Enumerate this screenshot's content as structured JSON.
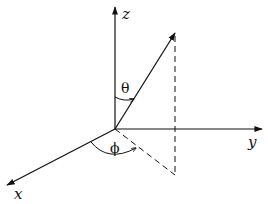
{
  "diagram": {
    "axes": [
      {
        "name": "z",
        "label": "z",
        "from": [
          115,
          129
        ],
        "to": [
          115,
          8
        ],
        "label_pos": [
          124,
          18
        ]
      },
      {
        "name": "y",
        "label": "y",
        "from": [
          115,
          129
        ],
        "to": [
          261,
          129
        ],
        "label_pos": [
          252,
          147
        ]
      },
      {
        "name": "x",
        "label": "x",
        "from": [
          115,
          129
        ],
        "to": [
          8,
          185
        ],
        "label_pos": [
          15,
          198
        ]
      }
    ],
    "vector": {
      "from": [
        115,
        129
      ],
      "to": [
        175,
        34
      ]
    },
    "projections": {
      "vertical": {
        "from": [
          175,
          34
        ],
        "to": [
          175,
          175
        ],
        "style": "dashed"
      },
      "horizontal": {
        "from": [
          115,
          129
        ],
        "to": [
          175,
          175
        ],
        "style": "dashed"
      }
    },
    "angles": [
      {
        "name": "theta",
        "symbol": "θ",
        "label_pos": [
          121,
          93
        ]
      },
      {
        "name": "phi",
        "symbol": "ϕ",
        "label_pos": [
          110,
          152
        ]
      }
    ],
    "colors": {
      "stroke": "#111111",
      "background": "#ffffff"
    }
  }
}
